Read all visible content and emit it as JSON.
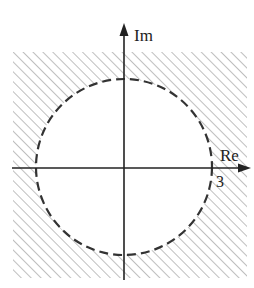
{
  "diagram": {
    "axes": {
      "imaginary_label": "Im",
      "real_label": "Re",
      "real_tick_label": "3"
    },
    "circle": {
      "center": [
        0,
        0
      ],
      "radius": 3,
      "style": "dashed",
      "boundary_included": false
    },
    "shaded_region": "|z| > 3 (exterior of circle, hatched)",
    "colors": {
      "line": "#222222",
      "hatch": "#8a8a8a",
      "background": "#ffffff"
    }
  }
}
